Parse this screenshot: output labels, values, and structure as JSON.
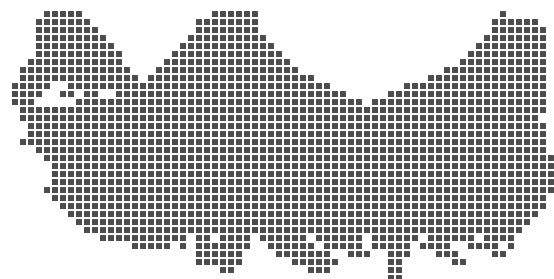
{
  "map": {
    "name": "Turkey",
    "style": "dotted-square-matrix",
    "dot_color": "#4d4d4d",
    "background_color": "#ffffff",
    "dot_size_px": 6.4,
    "grid_pitch_px": 8,
    "grid_origin_x_px": 4,
    "grid_origin_y_px": 11,
    "grid_columns": 69,
    "grid_rows": 33,
    "row_spans": [
      [
        [
          5,
          9
        ],
        [
          26,
          31
        ],
        [
          62,
          62
        ]
      ],
      [
        [
          4,
          10
        ],
        [
          24,
          31
        ],
        [
          61,
          66
        ]
      ],
      [
        [
          4,
          11
        ],
        [
          24,
          31
        ],
        [
          61,
          67
        ]
      ],
      [
        [
          4,
          12
        ],
        [
          23,
          32
        ],
        [
          60,
          67
        ]
      ],
      [
        [
          4,
          13
        ],
        [
          22,
          33
        ],
        [
          59,
          67
        ]
      ],
      [
        [
          4,
          14
        ],
        [
          21,
          34
        ],
        [
          58,
          67
        ]
      ],
      [
        [
          3,
          14
        ],
        [
          20,
          35
        ],
        [
          57,
          67
        ]
      ],
      [
        [
          2,
          15
        ],
        [
          19,
          36
        ],
        [
          55,
          67
        ]
      ],
      [
        [
          2,
          16
        ],
        [
          18,
          38
        ],
        [
          53,
          67
        ]
      ],
      [
        [
          1,
          5
        ],
        [
          8,
          17
        ],
        [
          17,
          40
        ],
        [
          50,
          67
        ]
      ],
      [
        [
          1,
          4
        ],
        [
          7,
          8
        ],
        [
          10,
          11
        ],
        [
          14,
          17
        ],
        [
          17,
          42
        ],
        [
          48,
          67
        ]
      ],
      [
        [
          1,
          3
        ],
        [
          9,
          17
        ],
        [
          17,
          44
        ],
        [
          46,
          67
        ]
      ],
      [
        [
          2,
          17
        ],
        [
          17,
          46
        ],
        [
          45,
          67
        ]
      ],
      [
        [
          2,
          17
        ],
        [
          17,
          66
        ]
      ],
      [
        [
          3,
          18
        ],
        [
          18,
          67
        ]
      ],
      [
        [
          3,
          19
        ],
        [
          19,
          67
        ]
      ],
      [
        [
          2,
          20
        ],
        [
          20,
          67
        ]
      ],
      [
        [
          4,
          21
        ],
        [
          21,
          67
        ]
      ],
      [
        [
          5,
          22
        ],
        [
          22,
          68
        ]
      ],
      [
        [
          6,
          23
        ],
        [
          23,
          68
        ]
      ],
      [
        [
          6,
          24
        ],
        [
          24,
          68
        ]
      ],
      [
        [
          6,
          25
        ],
        [
          25,
          68
        ]
      ],
      [
        [
          5,
          26
        ],
        [
          26,
          68
        ]
      ],
      [
        [
          6,
          27
        ],
        [
          27,
          67
        ]
      ],
      [
        [
          7,
          28
        ],
        [
          28,
          67
        ]
      ],
      [
        [
          8,
          29
        ],
        [
          29,
          66
        ]
      ],
      [
        [
          9,
          30
        ],
        [
          30,
          65
        ]
      ],
      [
        [
          10,
          31
        ],
        [
          31,
          64
        ]
      ],
      [
        [
          12,
          22
        ],
        [
          24,
          25
        ],
        [
          27,
          30
        ],
        [
          32,
          37
        ],
        [
          39,
          44
        ],
        [
          46,
          51
        ],
        [
          53,
          58
        ],
        [
          60,
          63
        ]
      ],
      [
        [
          16,
          20
        ],
        [
          22,
          22
        ],
        [
          24,
          30
        ],
        [
          33,
          38
        ],
        [
          40,
          44
        ],
        [
          46,
          50
        ],
        [
          52,
          55
        ],
        [
          58,
          61
        ],
        [
          63,
          63
        ]
      ],
      [
        [
          24,
          29
        ],
        [
          34,
          40
        ],
        [
          43,
          45
        ],
        [
          48,
          50
        ],
        [
          54,
          56
        ],
        [
          61,
          62
        ]
      ],
      [
        [
          24,
          29
        ],
        [
          36,
          41
        ],
        [
          48,
          49
        ],
        [
          56,
          57
        ]
      ],
      [
        [
          27,
          28
        ],
        [
          38,
          40
        ],
        [
          48,
          49
        ]
      ]
    ],
    "extra_dots": [
      [
        33,
        48,
        49
      ],
      [
        34,
        48,
        49
      ]
    ]
  }
}
